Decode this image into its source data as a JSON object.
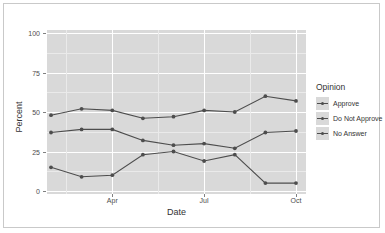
{
  "chart_data": {
    "type": "line",
    "title": "",
    "xlabel": "Date",
    "ylabel": "Percent",
    "legend_title": "Opinion",
    "legend_position": "right",
    "grid": true,
    "ylim": [
      0,
      100
    ],
    "yticks": [
      0,
      25,
      50,
      75,
      100
    ],
    "ytick_labels": [
      "0",
      "25",
      "50",
      "75",
      "100"
    ],
    "xticks": [
      "Apr",
      "Jul",
      "Oct"
    ],
    "x": [
      1,
      2,
      3,
      4,
      5,
      6,
      7,
      8,
      9
    ],
    "series": [
      {
        "name": "Approve",
        "color": "#4d4d4d",
        "values": [
          48,
          52,
          51,
          46,
          47,
          51,
          50,
          60,
          57
        ]
      },
      {
        "name": "Do Not Approve",
        "color": "#4d4d4d",
        "values": [
          37,
          39,
          39,
          32,
          29,
          30,
          27,
          37,
          38
        ]
      },
      {
        "name": "No Answer",
        "color": "#4d4d4d",
        "values": [
          15,
          9,
          10,
          23,
          25,
          19,
          23,
          5,
          5
        ]
      }
    ],
    "panel_background": "#d9d9d9",
    "grid_color": "#ffffff"
  },
  "axes": {
    "y_label": "Percent",
    "x_label": "Date"
  },
  "legend": {
    "title": "Opinion",
    "items": [
      {
        "label": "Approve"
      },
      {
        "label": "Do Not Approve"
      },
      {
        "label": "No Answer"
      }
    ]
  }
}
